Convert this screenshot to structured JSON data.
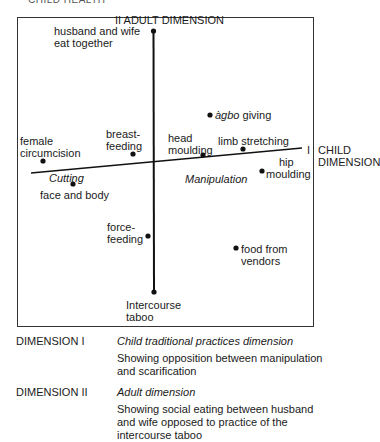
{
  "header": {
    "title_cut": "CHILD HEALTH"
  },
  "diagram": {
    "axes": {
      "vertical": {
        "label": "II ADULT DIMENSION",
        "top_item": "husband and wife eat together",
        "bottom_item": "Intercourse taboo"
      },
      "horizontal": {
        "label_numeral": "I",
        "label_line1": "CHILD",
        "label_line2": "DIMENSION"
      }
    },
    "region_labels": {
      "left": "Cutting",
      "right": "Manipulation"
    },
    "points": [
      {
        "id": "husband-wife",
        "line1": "husband and wife",
        "line2": "eat together",
        "x": 153,
        "y": 31
      },
      {
        "id": "female-circumcision",
        "line1": "female",
        "line2": "circumcision",
        "x": 43,
        "y": 161
      },
      {
        "id": "breast-feeding",
        "line1": "breast-",
        "line2": "feeding",
        "x": 133,
        "y": 154
      },
      {
        "id": "head-moulding",
        "line1": "head",
        "line2": "moulding",
        "x": 203,
        "y": 155
      },
      {
        "id": "agbo-giving",
        "line1_italic": "àgbo",
        "line1_rest": " giving",
        "x": 210,
        "y": 115
      },
      {
        "id": "limb-stretching",
        "line1": "limb stretching",
        "x": 243,
        "y": 149
      },
      {
        "id": "hip-moulding",
        "line1": "hip",
        "line2": "moulding",
        "x": 262,
        "y": 171
      },
      {
        "id": "face-and-body",
        "line1": "face and body",
        "x": 73,
        "y": 184
      },
      {
        "id": "force-feeding",
        "line1": "force-",
        "line2": "feeding",
        "x": 148,
        "y": 236
      },
      {
        "id": "food-from-vendors",
        "line1": "food from",
        "line2": "vendors",
        "x": 236,
        "y": 248
      },
      {
        "id": "intercourse-taboo",
        "line1": "Intercourse",
        "line2": "taboo",
        "x": 154,
        "y": 292
      }
    ]
  },
  "legend": [
    {
      "key": "DIMENSION I",
      "title": "Child traditional practices dimension",
      "description": "Showing opposition between manipulation and scarification"
    },
    {
      "key": "DIMENSION II",
      "title": "Adult dimension",
      "description": "Showing social eating between husband and wife opposed to practice of the intercourse taboo"
    }
  ]
}
